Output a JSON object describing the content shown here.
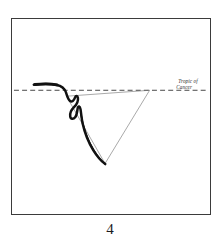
{
  "figure": {
    "number": "4",
    "caption_number": "4",
    "frame": {
      "x": 11,
      "y": 18,
      "width": 200,
      "height": 197,
      "border_color": "#3b3b3b",
      "background_color": "#ffffff"
    }
  },
  "annotations": {
    "reference_line_label_line1": "Tropic of",
    "reference_line_label_line2": "Cancer",
    "reference_line_label_full": "Tropic of Cancer"
  },
  "colors": {
    "ink_dark": "#111111",
    "ink_thin": "#6e6e6e",
    "frame": "#3b3b3b",
    "paper": "#ffffff",
    "label_text": "#2a2a2a"
  },
  "chart_data": {
    "type": "line",
    "title": "",
    "subtitle": "",
    "xlabel": "",
    "ylabel": "",
    "grid": false,
    "legend_position": "none",
    "xlim": [
      0,
      200
    ],
    "ylim": [
      0,
      197
    ],
    "annotations": [
      {
        "text": "Tropic of Cancer",
        "x": 168,
        "y": 66,
        "style": "handwritten-italic",
        "lines": [
          "Tropic of",
          "Cancer"
        ]
      }
    ],
    "series": [
      {
        "name": "reference-dashed-line",
        "style": "dashed",
        "color": "#333333",
        "width": 0.9,
        "points": [
          [
            2,
            72
          ],
          [
            198,
            72
          ]
        ]
      },
      {
        "name": "thin-triangle-outline",
        "style": "solid-thin",
        "color": "#6e6e6e",
        "width": 0.6,
        "points": [
          [
            55,
            78
          ],
          [
            139,
            72
          ],
          [
            94,
            146
          ],
          [
            55,
            78
          ]
        ]
      },
      {
        "name": "thick-drawn-curve",
        "style": "solid-thick-tapered",
        "color": "#111111",
        "width": 2.6,
        "points": [
          [
            22,
            67
          ],
          [
            38,
            66
          ],
          [
            48,
            68
          ],
          [
            53,
            73
          ],
          [
            55,
            79
          ],
          [
            58,
            83
          ],
          [
            62,
            81
          ],
          [
            64,
            78
          ],
          [
            66,
            79
          ],
          [
            66,
            84
          ],
          [
            63,
            88
          ],
          [
            60,
            93
          ],
          [
            59,
            99
          ],
          [
            62,
            100
          ],
          [
            65,
            96
          ],
          [
            66,
            90
          ],
          [
            68,
            89
          ],
          [
            69,
            95
          ],
          [
            70,
            104
          ],
          [
            75,
            118
          ],
          [
            82,
            131
          ],
          [
            89,
            141
          ],
          [
            94,
            146
          ]
        ]
      }
    ]
  }
}
